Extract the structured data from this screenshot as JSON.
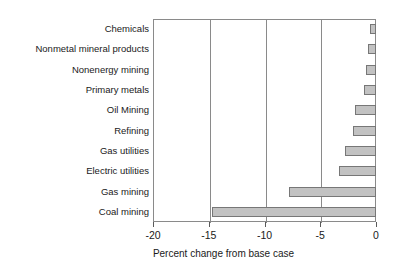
{
  "chart_data": {
    "type": "bar",
    "orientation": "horizontal",
    "title": "",
    "xlabel": "Percent change from base case",
    "ylabel": "",
    "xlim": [
      -20,
      0
    ],
    "ylim": null,
    "grid": true,
    "legend": false,
    "xticks": [
      -20,
      -15,
      -10,
      -5,
      0
    ],
    "xtick_labels": [
      "-20",
      "-15",
      "-10",
      "-5",
      "0"
    ],
    "categories": [
      "Chemicals",
      "Nonmetal mineral products",
      "Nonenergy mining",
      "Primary metals",
      "Oil Mining",
      "Refining",
      "Gas utilities",
      "Electric utilities",
      "Gas mining",
      "Coal mining"
    ],
    "values": [
      -0.5,
      -0.7,
      -0.9,
      -1.1,
      -1.9,
      -2.1,
      -2.8,
      -3.3,
      -7.8,
      -14.7
    ],
    "bar_fill_color": "#c2c2c2",
    "bar_edge_color": "#777777",
    "axis_color": "#8a8a8a",
    "background_color": "#ffffff"
  }
}
